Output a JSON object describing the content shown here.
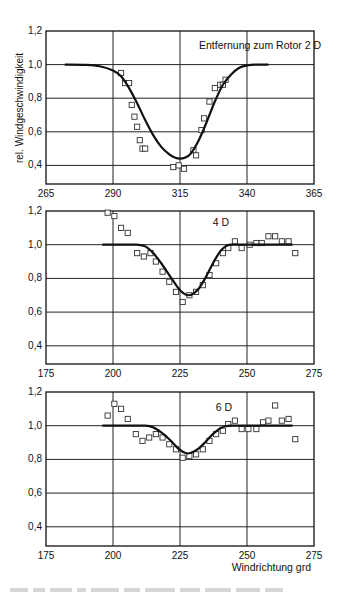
{
  "figure": {
    "ylabel": "rel. Windgeschwindigkeit",
    "xlabel": "Windrichtung grd"
  },
  "chart_data": [
    {
      "type": "scatter",
      "title": "Entfernung zum Rotor 2 D",
      "annotation": "Entfernung zum Rotor 2 D",
      "xlabel": "",
      "ylabel": "rel. Windgeschwindigkeit",
      "xlim": [
        265,
        365
      ],
      "ylim": [
        0.3,
        1.2
      ],
      "xticks": [
        "265",
        "290",
        "315",
        "340",
        "365"
      ],
      "yticks": [
        "0,4",
        "0,6",
        "0,8",
        "1,0",
        "1,2"
      ],
      "grid": true,
      "series": [
        {
          "name": "Messung",
          "kind": "markers-square",
          "x": [
            293,
            294.5,
            296,
            297,
            298,
            299,
            300,
            301,
            302,
            312.5,
            314.5,
            316.5,
            320,
            321,
            323,
            324,
            326,
            328,
            330,
            331,
            332
          ],
          "y": [
            0.95,
            0.89,
            0.89,
            0.76,
            0.69,
            0.63,
            0.55,
            0.5,
            0.5,
            0.39,
            0.4,
            0.38,
            0.49,
            0.46,
            0.61,
            0.68,
            0.78,
            0.86,
            0.88,
            0.88,
            0.91
          ]
        },
        {
          "name": "Modell",
          "kind": "line",
          "x": [
            272,
            280,
            285,
            290,
            293,
            296,
            299,
            302,
            305,
            308,
            311,
            313,
            315,
            317,
            319,
            322,
            325,
            328,
            331,
            334,
            337,
            340,
            343,
            348
          ],
          "y": [
            1.0,
            0.998,
            0.99,
            0.965,
            0.93,
            0.86,
            0.77,
            0.67,
            0.58,
            0.51,
            0.465,
            0.447,
            0.44,
            0.447,
            0.47,
            0.55,
            0.66,
            0.78,
            0.88,
            0.94,
            0.98,
            0.995,
            1.0,
            1.0
          ]
        }
      ]
    },
    {
      "type": "scatter",
      "title": "4 D",
      "annotation": "4 D",
      "xlabel": "",
      "ylabel": "",
      "xlim": [
        175,
        275
      ],
      "ylim": [
        0.3,
        1.2
      ],
      "xticks": [
        "175",
        "200",
        "225",
        "250",
        "275"
      ],
      "yticks": [
        "0,4",
        "0,6",
        "0,8",
        "1,0",
        "1,2"
      ],
      "grid": true,
      "series": [
        {
          "name": "Messung",
          "kind": "markers-square",
          "x": [
            198,
            200.5,
            203,
            205.5,
            209,
            211.5,
            214,
            216,
            218.5,
            221,
            223.5,
            226,
            228.5,
            231,
            233.5,
            236,
            238.5,
            241,
            243,
            245.5,
            248,
            251,
            253.5,
            255.5,
            258,
            260.5,
            263,
            265.5,
            268
          ],
          "y": [
            1.19,
            1.17,
            1.1,
            1.07,
            0.95,
            0.93,
            0.95,
            0.9,
            0.84,
            0.78,
            0.72,
            0.66,
            0.7,
            0.72,
            0.76,
            0.82,
            0.89,
            0.95,
            0.98,
            1.02,
            0.98,
            1.0,
            1.01,
            1.01,
            1.05,
            1.05,
            1.02,
            1.02,
            0.95
          ]
        },
        {
          "name": "Modell",
          "kind": "line",
          "x": [
            196,
            205,
            209,
            212,
            215,
            218,
            221,
            224,
            226,
            228,
            230,
            232,
            234,
            236,
            238,
            240,
            242,
            244,
            250,
            267
          ],
          "y": [
            1.0,
            1.0,
            1.0,
            0.99,
            0.95,
            0.89,
            0.82,
            0.75,
            0.715,
            0.7,
            0.71,
            0.74,
            0.79,
            0.85,
            0.91,
            0.96,
            0.99,
            1.0,
            1.0,
            1.0
          ]
        }
      ]
    },
    {
      "type": "scatter",
      "title": "6 D",
      "annotation": "6 D",
      "xlabel": "Windrichtung grd",
      "ylabel": "",
      "xlim": [
        175,
        275
      ],
      "ylim": [
        0.3,
        1.2
      ],
      "xticks": [
        "175",
        "200",
        "225",
        "250",
        "275"
      ],
      "yticks": [
        "0,4",
        "0,6",
        "0,8",
        "1,0",
        "1,2"
      ],
      "grid": true,
      "series": [
        {
          "name": "Messung",
          "kind": "markers-square",
          "x": [
            198,
            200.5,
            203,
            205.5,
            208.5,
            211,
            213.5,
            216,
            218.5,
            221,
            223.5,
            226,
            228.5,
            231,
            233.5,
            236,
            238.5,
            241,
            243,
            245.5,
            248,
            250.5,
            253.5,
            256,
            258,
            260.5,
            263,
            265.5,
            268
          ],
          "y": [
            1.06,
            1.13,
            1.1,
            1.04,
            0.95,
            0.91,
            0.93,
            0.95,
            0.93,
            0.89,
            0.86,
            0.81,
            0.82,
            0.83,
            0.86,
            0.91,
            0.95,
            0.97,
            1.01,
            1.03,
            0.98,
            0.98,
            0.98,
            1.02,
            1.03,
            1.12,
            1.03,
            1.04,
            0.92
          ]
        },
        {
          "name": "Modell",
          "kind": "line",
          "x": [
            196,
            205,
            212,
            215,
            218,
            221,
            224,
            226,
            228,
            230,
            232,
            234,
            236,
            238,
            240,
            242,
            244,
            250,
            267
          ],
          "y": [
            1.0,
            1.0,
            1.0,
            0.99,
            0.96,
            0.92,
            0.87,
            0.845,
            0.835,
            0.845,
            0.865,
            0.895,
            0.93,
            0.96,
            0.985,
            0.997,
            1.0,
            1.0,
            1.0
          ]
        }
      ]
    }
  ],
  "layout": {
    "panels": [
      {
        "left": 46,
        "right": 314,
        "top": 31,
        "px_per_0_2": 33.6,
        "bottom": 184,
        "ann_x": 260,
        "ann_y": 49,
        "ann_anchor": "middle"
      },
      {
        "left": 46,
        "right": 314,
        "top": 211,
        "px_per_0_2": 33.7,
        "bottom": 364,
        "ann_x": 221,
        "ann_y": 226,
        "ann_anchor": "middle"
      },
      {
        "left": 46,
        "right": 314,
        "top": 392,
        "px_per_0_2": 33.7,
        "bottom": 546,
        "ann_x": 224,
        "ann_y": 411,
        "ann_anchor": "middle"
      }
    ]
  }
}
